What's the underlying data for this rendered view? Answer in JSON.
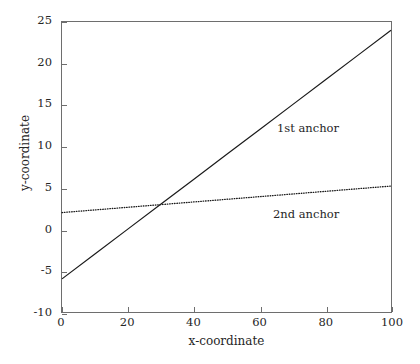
{
  "figure": {
    "background_color": "#ffffff",
    "axis_color": "#6e6e6e",
    "text_color": "#262626"
  },
  "axes": {
    "xlabel": "x-coordinate",
    "ylabel": "y-coordinate",
    "x_ticks": [
      "0",
      "20",
      "40",
      "60",
      "80",
      "100"
    ],
    "y_ticks": [
      "25",
      "20",
      "15",
      "10",
      "5",
      "0",
      "-5",
      "-10"
    ]
  },
  "annotations": {
    "first": "1st anchor",
    "second": "2nd anchor"
  },
  "chart_data": {
    "type": "line",
    "title": "",
    "xlabel": "x-coordinate",
    "ylabel": "y-coordinate",
    "xlim": [
      0,
      100
    ],
    "ylim": [
      -10,
      25
    ],
    "xticks": [
      0,
      20,
      40,
      60,
      80,
      100
    ],
    "yticks": [
      -10,
      -5,
      0,
      5,
      10,
      15,
      20,
      25
    ],
    "grid": false,
    "legend": "inline-annotations",
    "series": [
      {
        "name": "1st anchor",
        "style": "solid",
        "color": "#1a1a1a",
        "linewidth": 1.2,
        "x": [
          0,
          10,
          20,
          30,
          40,
          50,
          60,
          70,
          80,
          90,
          100
        ],
        "values": [
          -6.0,
          -3.0,
          0.0,
          3.0,
          6.0,
          9.0,
          12.0,
          15.0,
          18.0,
          21.0,
          24.0
        ],
        "annotation_text": "1st anchor",
        "annotation_xy": [
          62,
          13.5
        ]
      },
      {
        "name": "2nd anchor",
        "style": "dotted",
        "color": "#1a1a1a",
        "linewidth": 1.2,
        "x": [
          0,
          10,
          20,
          30,
          40,
          50,
          60,
          70,
          80,
          90,
          100
        ],
        "values": [
          2.0,
          2.32,
          2.64,
          2.96,
          3.28,
          3.6,
          3.92,
          4.24,
          4.56,
          4.88,
          5.2
        ],
        "annotation_text": "2nd anchor",
        "annotation_xy": [
          61,
          3.3
        ]
      }
    ]
  }
}
